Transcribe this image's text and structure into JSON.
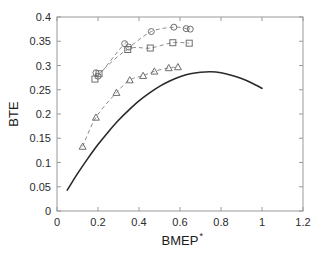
{
  "chart_data": {
    "type": "line",
    "title": "",
    "xlabel": "BMEP",
    "xlabel_superscript": "*",
    "ylabel": "BTE",
    "xlim": [
      0,
      1.2
    ],
    "ylim": [
      0,
      0.4
    ],
    "xticks": [
      0,
      0.2,
      0.4,
      0.6,
      0.8,
      1,
      1.2
    ],
    "xtick_labels": [
      "0",
      "0.2",
      "0.4",
      "0.6",
      "0.8",
      "1",
      "1.2"
    ],
    "yticks": [
      0,
      0.05,
      0.1,
      0.15,
      0.2,
      0.25,
      0.3,
      0.35,
      0.4
    ],
    "ytick_labels": [
      "0",
      "0.05",
      "0.1",
      "0.15",
      "0.2",
      "0.25",
      "0.3",
      "0.35",
      "0.4"
    ],
    "grid": false,
    "legend": null,
    "legend_position": "none",
    "series": [
      {
        "name": "baseline-curve",
        "style": "solid",
        "marker": "none",
        "color": "#2a2a2a",
        "x": [
          0.05,
          0.1,
          0.15,
          0.2,
          0.25,
          0.3,
          0.35,
          0.4,
          0.45,
          0.5,
          0.55,
          0.6,
          0.65,
          0.7,
          0.75,
          0.8,
          0.85,
          0.9,
          0.95,
          1.0
        ],
        "y": [
          0.043,
          0.077,
          0.108,
          0.137,
          0.163,
          0.187,
          0.208,
          0.227,
          0.243,
          0.257,
          0.268,
          0.277,
          0.283,
          0.286,
          0.287,
          0.285,
          0.28,
          0.273,
          0.264,
          0.253
        ]
      },
      {
        "name": "circle-series",
        "style": "dashed",
        "marker": "circle",
        "color": "#8c8c8c",
        "x": [
          0.19,
          0.2,
          0.33,
          0.35,
          0.46,
          0.57,
          0.63,
          0.65
        ],
        "y": [
          0.285,
          0.278,
          0.345,
          0.338,
          0.37,
          0.379,
          0.376,
          0.375
        ]
      },
      {
        "name": "square-series",
        "style": "dashed",
        "marker": "square",
        "color": "#8c8c8c",
        "x": [
          0.185,
          0.205,
          0.345,
          0.455,
          0.565,
          0.645
        ],
        "y": [
          0.272,
          0.283,
          0.333,
          0.336,
          0.347,
          0.346
        ]
      },
      {
        "name": "triangle-series",
        "style": "dashed",
        "marker": "triangle",
        "color": "#8c8c8c",
        "x": [
          0.125,
          0.19,
          0.29,
          0.355,
          0.42,
          0.475,
          0.545,
          0.59
        ],
        "y": [
          0.133,
          0.193,
          0.244,
          0.27,
          0.279,
          0.288,
          0.295,
          0.297
        ]
      }
    ]
  }
}
